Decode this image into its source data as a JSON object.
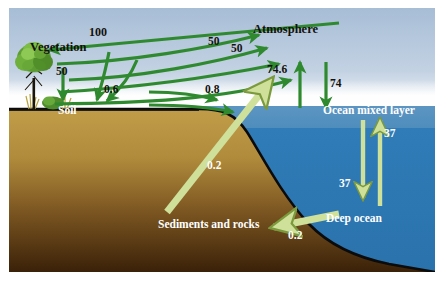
{
  "diagram": {
    "type": "diagram",
    "width": 444,
    "height": 281,
    "frame_border_color": "#ffffff",
    "colors": {
      "sky_top": "#aabfd6",
      "sky_bottom": "#ffffff",
      "haze": "#f4f6f8",
      "ocean_mixed": "#4f8fbf",
      "ocean_deep": "#2f7cb5",
      "soil_top": "#b99344",
      "soil_bottom": "#3a2208",
      "flux_arrow_green": "#2f8a2f",
      "flux_arrow_pale": "#cfdf96",
      "outline": "#0a0a0a"
    },
    "labels": {
      "vegetation": "Vegetation",
      "soil": "Soil",
      "atmosphere": "Atmosphere",
      "ocean_mixed_layer": "Ocean mixed layer",
      "deep_ocean": "Deep ocean",
      "sediments_and_rocks": "Sediments and rocks"
    },
    "fluxes": [
      {
        "id": "photosynthesis",
        "value": "100",
        "from": "Atmosphere",
        "to": "Vegetation",
        "style": "green",
        "direction": "left"
      },
      {
        "id": "plant-respiration",
        "value": "50",
        "from": "Vegetation",
        "to": "Atmosphere",
        "style": "green",
        "direction": "right"
      },
      {
        "id": "soil-respiration",
        "value": "50",
        "from": "Soil",
        "to": "Atmosphere",
        "style": "green",
        "direction": "right"
      },
      {
        "id": "vegetation-to-soil",
        "value": "50",
        "from": "Vegetation",
        "to": "Soil",
        "style": "green",
        "direction": "down"
      },
      {
        "id": "soil-runoff",
        "value": "0.6",
        "from": "Soil",
        "to": "Ocean",
        "style": "green",
        "direction": "right"
      },
      {
        "id": "river-transport",
        "value": "0.8",
        "from": "Land",
        "to": "Ocean mixed layer",
        "style": "green",
        "direction": "right"
      },
      {
        "id": "ocean-outgassing",
        "value": "74.6",
        "from": "Ocean mixed layer",
        "to": "Atmosphere",
        "style": "green",
        "direction": "up"
      },
      {
        "id": "ocean-uptake",
        "value": "74",
        "from": "Atmosphere",
        "to": "Ocean mixed layer",
        "style": "green",
        "direction": "down"
      },
      {
        "id": "downwelling",
        "value": "37",
        "from": "Ocean mixed layer",
        "to": "Deep ocean",
        "style": "pale",
        "direction": "down"
      },
      {
        "id": "upwelling",
        "value": "37",
        "from": "Deep ocean",
        "to": "Ocean mixed layer",
        "style": "pale",
        "direction": "up"
      },
      {
        "id": "rock-weathering",
        "value": "0.2",
        "from": "Sediments and rocks",
        "to": "Atmosphere",
        "style": "pale",
        "direction": "up-right"
      },
      {
        "id": "ocean-sedimentation",
        "value": "0.2",
        "from": "Deep ocean",
        "to": "Sediments and rocks",
        "style": "pale",
        "direction": "left"
      }
    ],
    "flux_labels": {
      "photosynthesis_100": "100",
      "plant_respiration_50": "50",
      "soil_respiration_50": "50",
      "veg_to_soil_50": "50",
      "soil_runoff_06": "0.6",
      "river_08": "0.8",
      "outgassing_746": "74.6",
      "uptake_74": "74",
      "downwelling_37": "37",
      "upwelling_37": "37",
      "weathering_02": "0.2",
      "sedimentation_02": "0.2"
    }
  }
}
